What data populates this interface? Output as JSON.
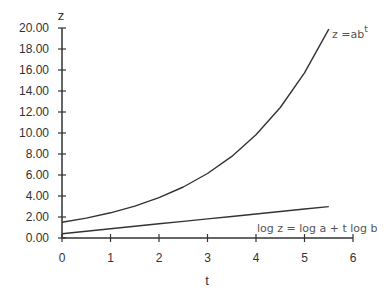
{
  "chart_data": {
    "type": "line",
    "title": "",
    "xlabel": "t",
    "ylabel": "z",
    "xlim": [
      0,
      6
    ],
    "ylim": [
      0,
      20
    ],
    "x_ticks": [
      "0",
      "1",
      "2",
      "3",
      "4",
      "5",
      "6"
    ],
    "y_ticks": [
      "0.00",
      "2.00",
      "4.00",
      "6.00",
      "8.00",
      "10.00",
      "12.00",
      "14.00",
      "16.00",
      "18.00",
      "20.00"
    ],
    "grid": false,
    "legend": "none (inline annotations)",
    "series": [
      {
        "name": "z = ab^t",
        "x": [
          0,
          0.5,
          1,
          1.5,
          2,
          2.5,
          3,
          3.5,
          4,
          4.5,
          5,
          5.5
        ],
        "values": [
          1.5,
          1.9,
          2.4,
          3.04,
          3.84,
          4.86,
          6.14,
          7.77,
          9.83,
          12.43,
          15.73,
          19.89
        ]
      },
      {
        "name": "log z = log a + t log b",
        "x": [
          0,
          0.5,
          1,
          1.5,
          2,
          2.5,
          3,
          3.5,
          4,
          4.5,
          5,
          5.5
        ],
        "values": [
          0.41,
          0.64,
          0.88,
          1.11,
          1.35,
          1.58,
          1.82,
          2.05,
          2.29,
          2.52,
          2.76,
          2.99
        ]
      }
    ],
    "annotations": [
      {
        "text": "z =ab",
        "superscript": "t",
        "near": "upper curve end"
      },
      {
        "text": "log z = log a + t log b",
        "near": "lower curve end"
      }
    ]
  },
  "labels": {
    "x_axis_title": "t",
    "y_axis_title": "z",
    "annot_exp_base": "z =ab",
    "annot_exp_sup": "t",
    "annot_log": "log z = log a + t log b"
  }
}
